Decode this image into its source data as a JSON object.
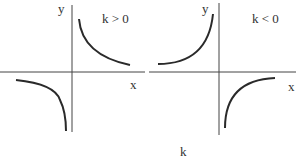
{
  "diagram": {
    "left_panel": {
      "condition": "k > 0",
      "x_label": "x",
      "y_label": "y",
      "branches": [
        "quadrant I",
        "quadrant III"
      ]
    },
    "right_panel": {
      "condition": "k < 0",
      "x_label": "x",
      "y_label": "y",
      "branches": [
        "quadrant II",
        "quadrant IV"
      ]
    },
    "caption": "k"
  },
  "colors": {
    "stroke": "#2a2a2a",
    "background": "#ffffff"
  }
}
